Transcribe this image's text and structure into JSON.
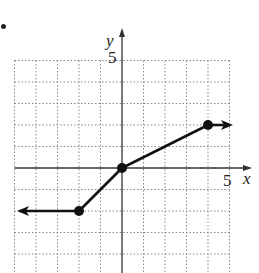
{
  "chart_data": {
    "type": "line",
    "title": "",
    "xlabel": "x",
    "ylabel": "y",
    "xlim": [
      -5,
      5
    ],
    "ylim": [
      -4,
      5
    ],
    "grid": true,
    "tick_labels": {
      "x": "5",
      "y": "5"
    },
    "points": [
      {
        "x": -2,
        "y": -2,
        "marker": "closed"
      },
      {
        "x": 0,
        "y": 0,
        "marker": "closed"
      },
      {
        "x": 4,
        "y": 2,
        "marker": "closed"
      }
    ],
    "segments": [
      {
        "from": [
          -5,
          -2
        ],
        "to": [
          -2,
          -2
        ],
        "arrow": "left"
      },
      {
        "from": [
          -2,
          -2
        ],
        "to": [
          0,
          0
        ]
      },
      {
        "from": [
          0,
          0
        ],
        "to": [
          4,
          2
        ]
      },
      {
        "from": [
          4,
          2
        ],
        "to": [
          5,
          2
        ],
        "arrow": "right"
      }
    ],
    "colors": {
      "line": "#111111",
      "grid": "#888888",
      "axis": "#333333"
    }
  },
  "labels": {
    "x_axis": "x",
    "y_axis": "y",
    "x_tick": "5",
    "y_tick": "5"
  }
}
